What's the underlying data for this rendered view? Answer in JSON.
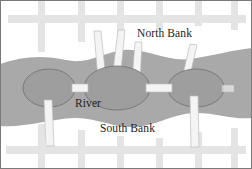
{
  "figure": {
    "name": "river-bridges-map",
    "width": 252,
    "height": 169,
    "background_color": "#ffffff",
    "border_color": "#7a7a7a"
  },
  "colors": {
    "land": "#ffffff",
    "water": "#a9a9a9",
    "island_fill": "#9e9e9e",
    "island_outline": "#6f6f6f",
    "road": "#e2e2e2",
    "bridge": "#f2f2f2",
    "bridge_outline": "#b8b8b8",
    "text": "#1c1c1c"
  },
  "labels": {
    "north_bank": "North Bank",
    "river": "River",
    "south_bank": "South Bank"
  },
  "map_data": {
    "type": "schematic-map",
    "description": "River flowing west to east with three islands connected to the north and south banks by bridges",
    "water_body": "River",
    "banks": [
      "North Bank",
      "South Bank"
    ],
    "islands": [
      {
        "id": "west-island",
        "cx": 49,
        "cy": 88,
        "rx": 26,
        "ry": 19
      },
      {
        "id": "center-island",
        "cx": 116,
        "cy": 88,
        "rx": 32,
        "ry": 22
      },
      {
        "id": "east-island",
        "cx": 196,
        "cy": 88,
        "rx": 28,
        "ry": 19
      }
    ],
    "bridges": [
      {
        "id": "bridge-center-to-north-1",
        "from": "center-island",
        "to": "North Bank"
      },
      {
        "id": "bridge-center-to-north-2",
        "from": "center-island",
        "to": "North Bank"
      },
      {
        "id": "bridge-center-to-north-3",
        "from": "center-island",
        "to": "North Bank"
      },
      {
        "id": "bridge-east-to-north",
        "from": "east-island",
        "to": "North Bank"
      },
      {
        "id": "bridge-west-to-center",
        "from": "west-island",
        "to": "center-island"
      },
      {
        "id": "bridge-center-to-east",
        "from": "center-island",
        "to": "east-island"
      },
      {
        "id": "bridge-west-to-south",
        "from": "west-island",
        "to": "South Bank"
      },
      {
        "id": "bridge-east-to-south",
        "from": "east-island",
        "to": "South Bank"
      },
      {
        "id": "bridge-east-edge",
        "from": "east-island",
        "to": "North Bank"
      }
    ],
    "roads": {
      "horizontal": [
        {
          "id": "north-road",
          "y": 18
        },
        {
          "id": "south-road",
          "y": 148
        }
      ],
      "vertical": [
        {
          "id": "road-v1",
          "x": 43
        },
        {
          "id": "road-v2",
          "x": 82
        },
        {
          "id": "road-v3",
          "x": 120
        },
        {
          "id": "road-v4",
          "x": 158
        },
        {
          "id": "road-v5",
          "x": 196
        },
        {
          "id": "road-v6",
          "x": 232
        }
      ]
    }
  }
}
